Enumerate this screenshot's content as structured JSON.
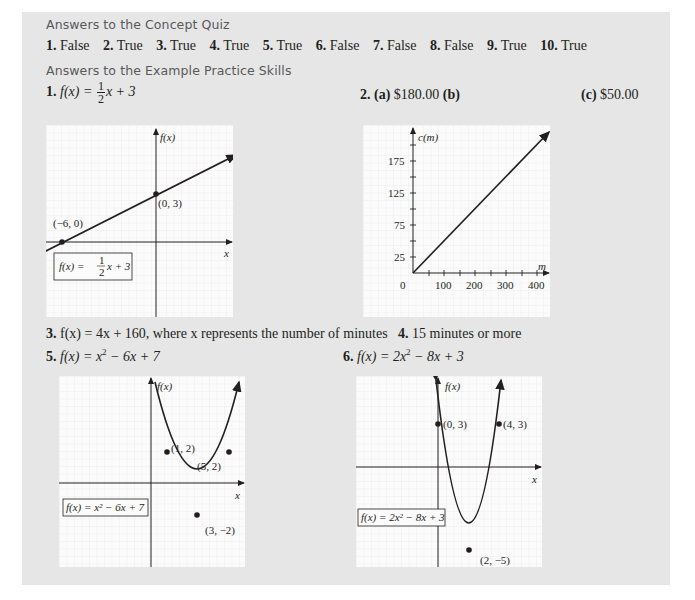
{
  "concept_quiz": {
    "heading": "Answers to the Concept Quiz",
    "answers": [
      {
        "num": "1.",
        "value": "False"
      },
      {
        "num": "2.",
        "value": "True"
      },
      {
        "num": "3.",
        "value": "True"
      },
      {
        "num": "4.",
        "value": "True"
      },
      {
        "num": "5.",
        "value": "True"
      },
      {
        "num": "6.",
        "value": "False"
      },
      {
        "num": "7.",
        "value": "False"
      },
      {
        "num": "8.",
        "value": "False"
      },
      {
        "num": "9.",
        "value": "True"
      },
      {
        "num": "10.",
        "value": "True"
      }
    ]
  },
  "practice": {
    "heading": "Answers to the Example Practice Skills",
    "p1": {
      "num": "1.",
      "lhs": "f(x) =",
      "frac_num": "1",
      "frac_den": "2",
      "rhs": "x + 3"
    },
    "p2": {
      "num": "2.",
      "a_label": "(a)",
      "a_value": "$180.00",
      "b_label": "(b)",
      "c_label": "(c)",
      "c_value": "$50.00"
    },
    "p3": {
      "num": "3.",
      "text": "f(x) = 4x + 160, where x represents the number of minutes"
    },
    "p4": {
      "num": "4.",
      "text": "15 minutes or more"
    },
    "p5": {
      "num": "5.",
      "lhs": "f(x) = x",
      "sup": "2",
      "rhs": " − 6x + 7"
    },
    "p6": {
      "num": "6.",
      "lhs": "f(x) = 2x",
      "sup": "2",
      "rhs": " − 8x + 3"
    }
  },
  "graphs": {
    "g1": {
      "y_axis_label": "f(x)",
      "x_axis_label": "x",
      "point_a": "(0, 3)",
      "point_b": "(−6, 0)",
      "legend_lhs": "f(x) =",
      "legend_num": "1",
      "legend_den": "2",
      "legend_rhs": "x + 3"
    },
    "g2": {
      "y_axis_label": "c(m)",
      "x_axis_label": "m",
      "y_ticks": [
        "175",
        "125",
        "75",
        "25"
      ],
      "x_ticks": [
        "0",
        "100",
        "200",
        "300",
        "400"
      ]
    },
    "g3": {
      "y_axis_label": "f(x)",
      "x_axis_label": "x",
      "point_a": "(1, 2)",
      "point_b": "(5, 2)",
      "vertex": "(3, −2)",
      "legend": "f(x) = x² − 6x + 7"
    },
    "g4": {
      "y_axis_label": "f(x)",
      "x_axis_label": "x",
      "point_a": "(0, 3)",
      "point_b": "(4, 3)",
      "vertex": "(2, −5)",
      "legend": "f(x) = 2x² − 8x + 3"
    }
  }
}
